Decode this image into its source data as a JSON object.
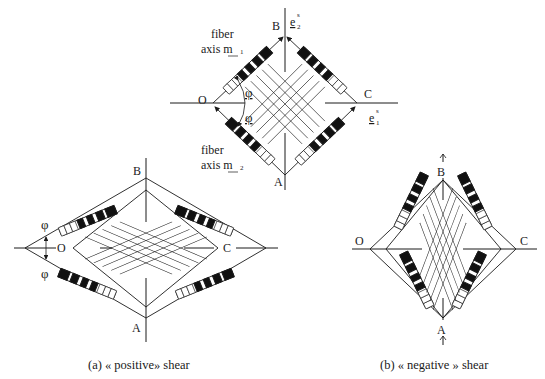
{
  "figure": {
    "top_diagram": {
      "labels": {
        "B": "B",
        "O": "O",
        "C": "C",
        "A": "A"
      },
      "basis": {
        "e2": "e",
        "e2_sup": "s",
        "e2_sub": "2",
        "e1": "e",
        "e1_sup": "s",
        "e1_sub": "1"
      },
      "fiber1": {
        "line1": "fiber",
        "line2": "axis m",
        "sub": "1"
      },
      "fiber2": {
        "line1": "fiber",
        "line2": "axis m",
        "sub": "2"
      },
      "angle_upper": "φ",
      "angle_lower": "φ"
    },
    "left_diagram": {
      "labels": {
        "B": "B",
        "O": "O",
        "C": "C",
        "A": "A"
      },
      "angle_upper": "φ",
      "angle_lower": "φ",
      "caption": "(a) « positive» shear"
    },
    "right_diagram": {
      "labels": {
        "B": "B",
        "O": "O",
        "C": "C",
        "A": "A"
      },
      "caption": "(b) « negative » shear"
    },
    "colors": {
      "ink": "#1a1a1a",
      "background": "#ffffff"
    }
  }
}
